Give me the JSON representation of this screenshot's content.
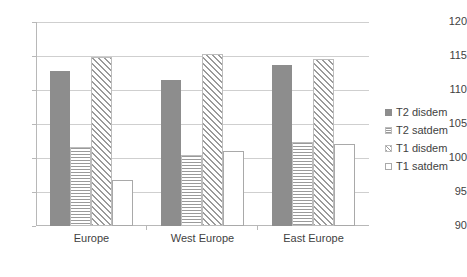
{
  "chart_data": {
    "type": "bar",
    "title": "",
    "subtitle": "",
    "xlabel": "",
    "ylabel": "",
    "categories": [
      "Europe",
      "West Europe",
      "East Europe"
    ],
    "series": [
      {
        "name": "T2 disdem",
        "values": [
          112.8,
          111.5,
          113.7
        ],
        "fill": "solid-gray",
        "color": "#8d8d8d"
      },
      {
        "name": "T2 satdem",
        "values": [
          101.6,
          100.4,
          102.4
        ],
        "fill": "horizontal-lines",
        "color": "#9a9a9a"
      },
      {
        "name": "T1 disdem",
        "values": [
          114.8,
          115.3,
          114.6
        ],
        "fill": "diagonal-hatch",
        "color": "#9a9a9a"
      },
      {
        "name": "T1 satdem",
        "values": [
          101.8,
          101.0,
          102.1
        ],
        "fill": "open-white",
        "color": "#ffffff"
      }
    ],
    "ylim": [
      90,
      120
    ],
    "yticks": [
      90,
      95,
      100,
      105,
      110,
      115,
      120
    ],
    "ytick_labels": [
      "90",
      "95",
      "100",
      "105",
      "110",
      "115",
      "120"
    ],
    "grid": true,
    "grid_axis": "y",
    "legend_position": "right",
    "baseline": 90,
    "series_baselines": [
      [
        90,
        90,
        90
      ],
      [
        90,
        90,
        90
      ],
      [
        90,
        90,
        90
      ],
      [
        95,
        90,
        90
      ]
    ]
  },
  "legend": {
    "items": [
      {
        "label": "T2 disdem"
      },
      {
        "label": "T2 satdem"
      },
      {
        "label": "T1 disdem"
      },
      {
        "label": "T1 satdem"
      }
    ]
  }
}
